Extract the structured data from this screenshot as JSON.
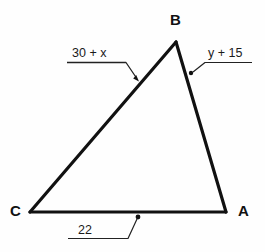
{
  "diagram": {
    "type": "triangle",
    "background_color": "#fefefe",
    "stroke_color": "#111111",
    "vertices": [
      {
        "name": "B",
        "label": "B",
        "x": 176,
        "y": 42
      },
      {
        "name": "A",
        "label": "A",
        "x": 226,
        "y": 212
      },
      {
        "name": "C",
        "label": "C",
        "x": 30,
        "y": 212
      }
    ],
    "sides": [
      {
        "name": "side-CB",
        "from": "C",
        "to": "B",
        "measure_label": "30 + x",
        "leader": {
          "underline_from_x": 67,
          "underline_to_x": 126,
          "underline_y": 62,
          "tip_x": 139,
          "tip_y": 81,
          "end_marker": "arrowhead"
        }
      },
      {
        "name": "side-BA",
        "from": "B",
        "to": "A",
        "measure_label": "y + 15",
        "leader": {
          "underline_from_x": 205,
          "underline_to_x": 252,
          "underline_y": 62,
          "tip_x": 191,
          "tip_y": 73,
          "end_marker": "dot"
        }
      },
      {
        "name": "side-CA",
        "from": "C",
        "to": "A",
        "measure_label": "22",
        "leader": {
          "underline_from_x": 68,
          "underline_to_x": 128,
          "underline_y": 238,
          "tip_x": 138,
          "tip_y": 217,
          "end_marker": "dot"
        }
      }
    ]
  }
}
